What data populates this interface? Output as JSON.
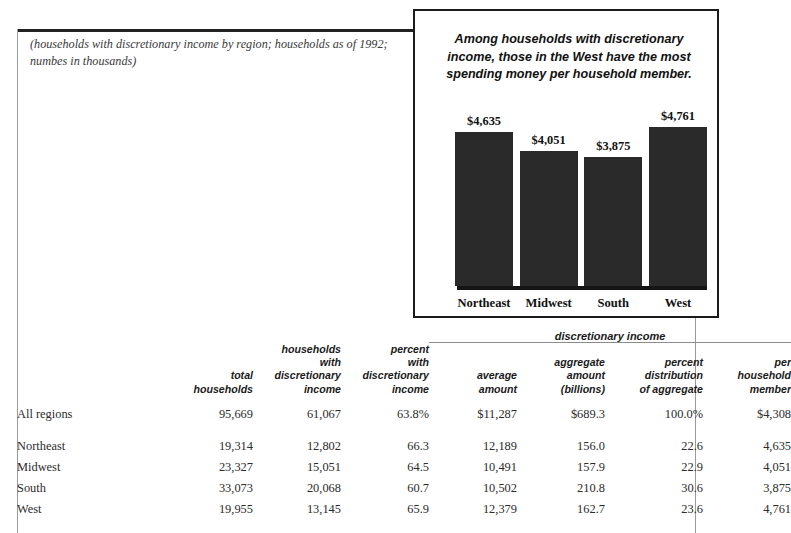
{
  "page": {
    "caption": "(households with discretionary income by region; households as of 1992; numbes in thousands)"
  },
  "chart_data": {
    "type": "bar",
    "title": "Among households with discretionary income, those in the West have the most spending money per household member.",
    "xlabel": "",
    "ylabel": "",
    "categories": [
      "Northeast",
      "Midwest",
      "South",
      "West"
    ],
    "values": [
      4635,
      4051,
      3875,
      4761
    ],
    "value_labels": [
      "$4,635",
      "$4,051",
      "$3,875",
      "$4,761"
    ],
    "ylim": [
      0,
      5400
    ],
    "grid": false,
    "legend": "none",
    "bar_color": "#2a2a2a"
  },
  "table": {
    "group_header": "discretionary income",
    "columns": [
      {
        "key": "region",
        "label": ""
      },
      {
        "key": "total",
        "label": "total\nhouseholds"
      },
      {
        "key": "hh_disc",
        "label": "households\nwith\ndiscretionary\nincome"
      },
      {
        "key": "pct_disc",
        "label": "percent\nwith\ndiscretionary\nincome"
      },
      {
        "key": "avg_amount",
        "label": "average\namount"
      },
      {
        "key": "agg_amount",
        "label": "aggregate\namount\n(billions)"
      },
      {
        "key": "pct_dist",
        "label": "percent\ndistribution\nof aggregate"
      },
      {
        "key": "per_member",
        "label": "per\nhousehold\nmember"
      }
    ],
    "rows": [
      {
        "region": "All regions",
        "total": "95,669",
        "hh_disc": "61,067",
        "pct_disc": "63.8%",
        "avg_amount": "$11,287",
        "agg_amount": "$689.3",
        "pct_dist": "100.0%",
        "per_member": "$4,308"
      },
      {
        "region": "Northeast",
        "total": "19,314",
        "hh_disc": "12,802",
        "pct_disc": "66.3",
        "avg_amount": "12,189",
        "agg_amount": "156.0",
        "pct_dist": "22.6",
        "per_member": "4,635"
      },
      {
        "region": "Midwest",
        "total": "23,327",
        "hh_disc": "15,051",
        "pct_disc": "64.5",
        "avg_amount": "10,491",
        "agg_amount": "157.9",
        "pct_dist": "22.9",
        "per_member": "4,051"
      },
      {
        "region": "South",
        "total": "33,073",
        "hh_disc": "20,068",
        "pct_disc": "60.7",
        "avg_amount": "10,502",
        "agg_amount": "210.8",
        "pct_dist": "30.6",
        "per_member": "3,875"
      },
      {
        "region": "West",
        "total": "19,955",
        "hh_disc": "13,145",
        "pct_disc": "65.9",
        "avg_amount": "12,379",
        "agg_amount": "162.7",
        "pct_dist": "23.6",
        "per_member": "4,761"
      }
    ]
  }
}
